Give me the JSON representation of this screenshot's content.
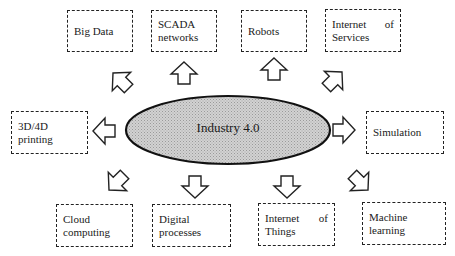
{
  "diagram": {
    "center": {
      "label": "Industry 4.0",
      "fill": "#c8c8c8",
      "stroke": "#111111"
    },
    "nodes": [
      {
        "id": "big-data",
        "lines": [
          "Big Data"
        ]
      },
      {
        "id": "scada-networks",
        "lines": [
          "SCADA",
          "networks"
        ]
      },
      {
        "id": "robots",
        "lines": [
          "Robots"
        ]
      },
      {
        "id": "internet-of-services",
        "lines": [
          "Internet",
          "of",
          "Services"
        ]
      },
      {
        "id": "3d4d-printing",
        "lines": [
          "3D/4D",
          "printing"
        ]
      },
      {
        "id": "simulation",
        "lines": [
          "Simulation"
        ]
      },
      {
        "id": "cloud-computing",
        "lines": [
          "Cloud",
          "computing"
        ]
      },
      {
        "id": "digital-processes",
        "lines": [
          "Digital",
          "processes"
        ]
      },
      {
        "id": "internet-of-things",
        "lines": [
          "Internet",
          "of",
          "Things"
        ]
      },
      {
        "id": "machine-learning",
        "lines": [
          "Machine",
          "learning"
        ]
      }
    ],
    "edges": [
      {
        "from": "center",
        "to": "big-data",
        "style": "hollow-block-arrow"
      },
      {
        "from": "center",
        "to": "scada-networks",
        "style": "hollow-block-arrow"
      },
      {
        "from": "center",
        "to": "robots",
        "style": "hollow-block-arrow"
      },
      {
        "from": "center",
        "to": "internet-of-services",
        "style": "hollow-block-arrow"
      },
      {
        "from": "center",
        "to": "3d4d-printing",
        "style": "hollow-block-arrow"
      },
      {
        "from": "center",
        "to": "simulation",
        "style": "hollow-block-arrow"
      },
      {
        "from": "center",
        "to": "cloud-computing",
        "style": "hollow-block-arrow"
      },
      {
        "from": "center",
        "to": "digital-processes",
        "style": "hollow-block-arrow"
      },
      {
        "from": "center",
        "to": "internet-of-things",
        "style": "hollow-block-arrow"
      },
      {
        "from": "center",
        "to": "machine-learning",
        "style": "hollow-block-arrow"
      }
    ]
  }
}
